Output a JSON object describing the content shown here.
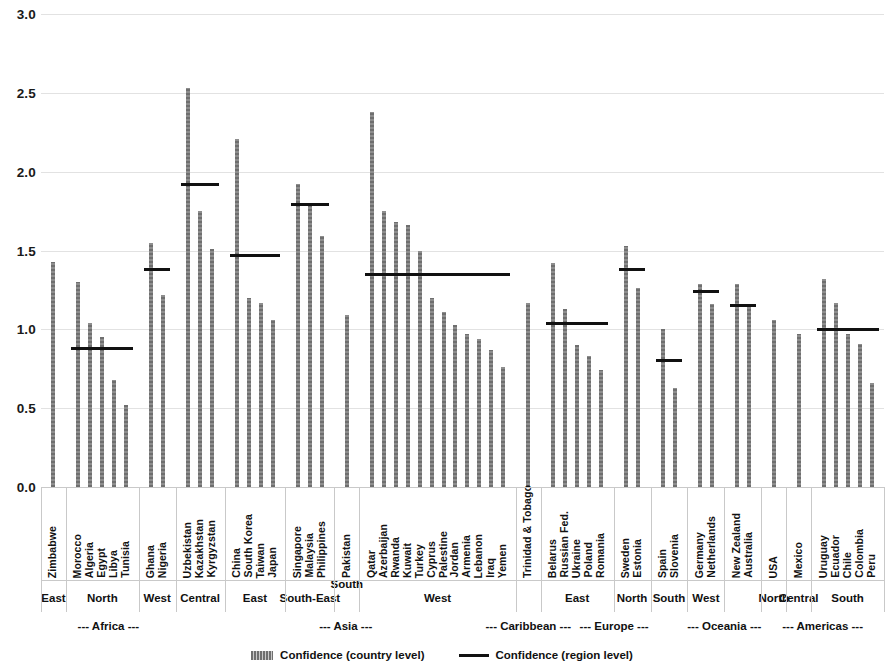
{
  "chart_data": {
    "type": "bar",
    "title": "",
    "xlabel": "",
    "ylabel": "",
    "ylim": [
      0.0,
      3.0
    ],
    "yticks": [
      "0.0",
      "0.5",
      "1.0",
      "1.5",
      "2.0",
      "2.5",
      "3.0"
    ],
    "ytick_values": [
      0.0,
      0.5,
      1.0,
      1.5,
      2.0,
      2.5,
      3.0
    ],
    "grid": true,
    "legend": [
      {
        "label": "Confidence (country level)",
        "marker": "bar",
        "color": "#7b7b7b"
      },
      {
        "label": "Confidence (region level)",
        "marker": "line",
        "color": "#111111"
      }
    ],
    "series": [
      {
        "name": "Confidence (country level)",
        "type": "bar"
      },
      {
        "name": "Confidence (region level)",
        "type": "reference-line"
      }
    ],
    "groups": [
      {
        "continent": "--- Africa ---",
        "subregion": "East",
        "region_value": null,
        "categories": [
          "Zimbabwe"
        ],
        "values": [
          1.43
        ]
      },
      {
        "continent": "--- Africa ---",
        "subregion": "North",
        "region_value": 0.88,
        "categories": [
          "Morocco",
          "Algeria",
          "Egypt",
          "Libya",
          "Tunisia"
        ],
        "values": [
          1.3,
          1.04,
          0.95,
          0.68,
          0.52
        ]
      },
      {
        "continent": "--- Africa ---",
        "subregion": "West",
        "region_value": 1.38,
        "categories": [
          "Ghana",
          "Nigeria"
        ],
        "values": [
          1.55,
          1.22
        ]
      },
      {
        "continent": "--- Asia ---",
        "subregion": "Central",
        "region_value": 1.92,
        "categories": [
          "Uzbekistan",
          "Kazakhstan",
          "Kyrgyzstan"
        ],
        "values": [
          2.53,
          1.75,
          1.51
        ]
      },
      {
        "continent": "--- Asia ---",
        "subregion": "East",
        "region_value": 1.47,
        "categories": [
          "China",
          "South Korea",
          "Taiwan",
          "Japan"
        ],
        "values": [
          2.21,
          1.2,
          1.17,
          1.06
        ]
      },
      {
        "continent": "--- Asia ---",
        "subregion": "South-East",
        "region_value": 1.79,
        "categories": [
          "Singapore",
          "Malaysia",
          "Philippines"
        ],
        "values": [
          1.92,
          1.79,
          1.59
        ]
      },
      {
        "continent": "--- Asia ---",
        "subregion": "South",
        "region_value": null,
        "categories": [
          "Pakistan"
        ],
        "values": [
          1.09
        ]
      },
      {
        "continent": "--- Asia ---",
        "subregion": "West",
        "region_value": 1.35,
        "categories": [
          "Qatar",
          "Azerbaijan",
          "Rwanda",
          "Kuwait",
          "Turkey",
          "Cyprus",
          "Palestine",
          "Jordan",
          "Armenia",
          "Lebanon",
          "Iraq",
          "Yemen"
        ],
        "values": [
          2.38,
          1.75,
          1.68,
          1.66,
          1.5,
          1.2,
          1.11,
          1.03,
          0.97,
          0.94,
          0.87,
          0.76
        ]
      },
      {
        "continent": "--- Caribbean ---",
        "subregion": "",
        "region_value": null,
        "categories": [
          "Trinidad & Tobago"
        ],
        "values": [
          1.17
        ]
      },
      {
        "continent": "--- Europe ---",
        "subregion": "East",
        "region_value": 1.04,
        "categories": [
          "Belarus",
          "Russian Fed.",
          "Ukraine",
          "Poland",
          "Romania"
        ],
        "values": [
          1.42,
          1.13,
          0.9,
          0.83,
          0.74
        ]
      },
      {
        "continent": "--- Europe ---",
        "subregion": "North",
        "region_value": 1.38,
        "categories": [
          "Sweden",
          "Estonia"
        ],
        "values": [
          1.53,
          1.26
        ]
      },
      {
        "continent": "--- Europe ---",
        "subregion": "South",
        "region_value": 0.8,
        "categories": [
          "Spain",
          "Slovenia"
        ],
        "values": [
          1.0,
          0.63
        ]
      },
      {
        "continent": "--- Oceania ---",
        "subregion": "West",
        "region_value": 1.24,
        "categories": [
          "Germany",
          "Netherlands"
        ],
        "values": [
          1.29,
          1.16
        ]
      },
      {
        "continent": "--- Oceania ---",
        "subregion": "",
        "region_value": 1.15,
        "categories": [
          "New Zealand",
          "Australia"
        ],
        "values": [
          1.29,
          1.14
        ]
      },
      {
        "continent": "--- Americas ---",
        "subregion": "North",
        "region_value": null,
        "categories": [
          "USA"
        ],
        "values": [
          1.06
        ]
      },
      {
        "continent": "--- Americas ---",
        "subregion": "Central",
        "region_value": null,
        "categories": [
          "Mexico"
        ],
        "values": [
          0.97
        ]
      },
      {
        "continent": "--- Americas ---",
        "subregion": "South",
        "region_value": 1.0,
        "categories": [
          "Uruguay",
          "Ecuador",
          "Chile",
          "Colombia",
          "Peru"
        ],
        "values": [
          1.32,
          1.17,
          0.97,
          0.91,
          0.66
        ]
      }
    ]
  },
  "axis": {
    "subregion_labels": [
      {
        "text": "East",
        "group": 0,
        "raised": false
      },
      {
        "text": "North",
        "group": 1,
        "raised": false
      },
      {
        "text": "West",
        "group": 2,
        "raised": false
      },
      {
        "text": "Central",
        "group": 3,
        "raised": false
      },
      {
        "text": "East",
        "group": 4,
        "raised": false
      },
      {
        "text": "South-East",
        "group": 5,
        "raised": false
      },
      {
        "text": "South",
        "group": 6,
        "raised": true
      },
      {
        "text": "West",
        "group": 7,
        "raised": false
      },
      {
        "text": "East",
        "group": 9,
        "raised": false
      },
      {
        "text": "North",
        "group": 10,
        "raised": false
      },
      {
        "text": "South",
        "group": 11,
        "raised": false
      },
      {
        "text": "West",
        "group": 12,
        "raised": false
      },
      {
        "text": "North",
        "group": 14,
        "raised": false
      },
      {
        "text": "Central",
        "group": 15,
        "raised": false
      },
      {
        "text": "South",
        "group": 16,
        "raised": false
      }
    ],
    "continent_labels": [
      {
        "text": "--- Africa ---",
        "from": 0,
        "to": 2
      },
      {
        "text": "--- Asia ---",
        "from": 3,
        "to": 7
      },
      {
        "text": "--- Caribbean ---",
        "from": 8,
        "to": 8
      },
      {
        "text": "--- Europe ---",
        "from": 9,
        "to": 11
      },
      {
        "text": "--- Oceania ---",
        "from": 12,
        "to": 13
      },
      {
        "text": "--- Americas ---",
        "from": 14,
        "to": 16
      }
    ]
  },
  "colors": {
    "bar": "#7b7b7b",
    "region_line": "#111111",
    "gridline": "#e2e2e2",
    "separator": "#c9c9c9",
    "text": "#1a1a1a"
  }
}
